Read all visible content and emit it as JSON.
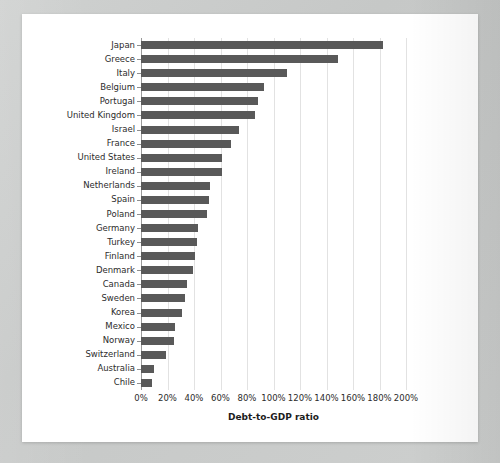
{
  "chart_data": {
    "type": "bar",
    "orientation": "horizontal",
    "title": "",
    "xlabel": "Debt-to-GDP ratio",
    "ylabel": "",
    "xlim": [
      0,
      200
    ],
    "xtick_labels": [
      "0%",
      "20%",
      "40%",
      "60%",
      "80%",
      "100%",
      "120%",
      "140%",
      "160%",
      "180%",
      "200%"
    ],
    "xtick_values": [
      0,
      20,
      40,
      60,
      80,
      100,
      120,
      140,
      160,
      180,
      200
    ],
    "grid": true,
    "legend": "none",
    "bar_color": "#595959",
    "categories": [
      "Japan",
      "Greece",
      "Italy",
      "Belgium",
      "Portugal",
      "United Kingdom",
      "Israel",
      "France",
      "United States",
      "Ireland",
      "Netherlands",
      "Spain",
      "Poland",
      "Germany",
      "Turkey",
      "Finland",
      "Denmark",
      "Canada",
      "Sweden",
      "Korea",
      "Mexico",
      "Norway",
      "Switzerland",
      "Australia",
      "Chile"
    ],
    "values": [
      183,
      149,
      110,
      93,
      88,
      86,
      74,
      68,
      61,
      61,
      52,
      51,
      50,
      43,
      42,
      41,
      39,
      35,
      33,
      31,
      26,
      25,
      19,
      10,
      8
    ]
  }
}
